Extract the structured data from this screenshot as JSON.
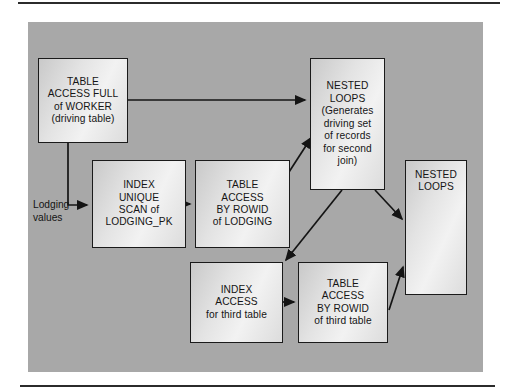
{
  "figure": {
    "type": "flowchart",
    "panel_color": "#a8a8a8",
    "box_fill": "#eeeeee",
    "line_color": "#1a1a1a"
  },
  "nodes": [
    {
      "id": "table-access-full-worker",
      "lines": [
        "TABLE",
        "ACCESS FULL",
        "of WORKER",
        "(driving table)"
      ],
      "x": 38,
      "y": 58,
      "w": 90,
      "h": 85
    },
    {
      "id": "index-unique-scan-lodging-pk",
      "lines": [
        "INDEX",
        "UNIQUE",
        "SCAN of",
        "LODGING_PK"
      ],
      "x": 92,
      "y": 160,
      "w": 94,
      "h": 88
    },
    {
      "id": "table-access-by-rowid-lodging",
      "lines": [
        "TABLE",
        "ACCESS",
        "BY ROWID",
        "of LODGING"
      ],
      "x": 195,
      "y": 160,
      "w": 95,
      "h": 88
    },
    {
      "id": "nested-loops-generates",
      "lines": [
        "NESTED",
        "LOOPS",
        "(Generates",
        "driving set",
        "of records",
        "for second",
        "join)"
      ],
      "x": 310,
      "y": 58,
      "w": 75,
      "h": 132
    },
    {
      "id": "nested-loops-final",
      "lines": [
        "NESTED",
        "LOOPS"
      ],
      "x": 405,
      "y": 160,
      "w": 62,
      "h": 135
    },
    {
      "id": "index-access-third-table",
      "lines": [
        "INDEX",
        "ACCESS",
        "for third table"
      ],
      "x": 190,
      "y": 262,
      "w": 93,
      "h": 81
    },
    {
      "id": "table-access-by-rowid-third-table",
      "lines": [
        "TABLE",
        "ACCESS",
        "BY ROWID",
        "of third table"
      ],
      "x": 298,
      "y": 262,
      "w": 90,
      "h": 81
    }
  ],
  "labels": [
    {
      "id": "lodging-values",
      "lines": [
        "Lodging",
        "values"
      ],
      "x": 33,
      "y": 198
    }
  ],
  "edges": [
    {
      "id": "worker-to-nested-loops",
      "kind": "straight",
      "points": "128,100 305,100"
    },
    {
      "id": "worker-to-index-unique-scan",
      "kind": "elbow",
      "points": "68,143 68,205 87,205"
    },
    {
      "id": "index-unique-scan-to-table-access-lodging",
      "kind": "straight",
      "points": "186,204 190,204"
    },
    {
      "id": "table-access-lodging-to-nested-loops",
      "kind": "straight",
      "points": "289,172 311,138"
    },
    {
      "id": "nested-loops-to-index-access-third",
      "kind": "straight",
      "points": "342,190 286,260"
    },
    {
      "id": "nested-loops-to-final-nested-loops",
      "kind": "straight",
      "points": "375,190 402,219"
    },
    {
      "id": "index-access-third-to-table-access-third",
      "kind": "straight",
      "points": "283,302 294,302"
    },
    {
      "id": "table-access-third-to-final-nested-loops",
      "kind": "straight",
      "points": "389,310 403,267"
    }
  ]
}
